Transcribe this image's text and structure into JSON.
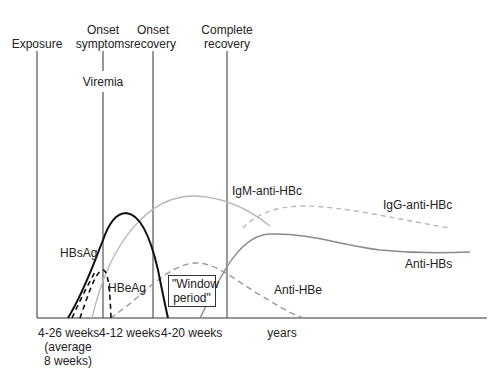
{
  "diagram": {
    "events": [
      {
        "label": "Exposure",
        "x": 37
      },
      {
        "label": "Onset\nsymptoms",
        "line1": "Onset",
        "line2": "symptoms",
        "x": 102
      },
      {
        "label": "Onset\nrecovery",
        "line1": "Onset",
        "line2": "recovery",
        "x": 152
      },
      {
        "label": "Complete\nrecovery",
        "line1": "Complete",
        "line2": "recovery",
        "x": 226
      }
    ],
    "viremia_label": "Viremia",
    "window_period": {
      "line1": "\"Window",
      "line2": "period\""
    },
    "markers": {
      "hbsag": "HBsAg",
      "hbeag": "HBeAg",
      "igm_anti_hbc": "IgM-anti-HBc",
      "igg_anti_hbc": "IgG-anti-HBc",
      "anti_hbs": "Anti-HBs",
      "anti_hbe": "Anti-HBe"
    },
    "time_axis": {
      "intervals": [
        {
          "line1": "4-26 weeks",
          "line2": "(average",
          "line3": "8 weeks)"
        },
        {
          "line1": "4-12 weeks"
        },
        {
          "line1": "4-20 weeks"
        },
        {
          "line1": "years"
        }
      ]
    },
    "colors": {
      "hbsag": "#111111",
      "hbeag": "#111111",
      "igm_anti_hbc": "#b5b5b5",
      "igg_anti_hbc": "#b5b5b5",
      "anti_hbs": "#8a8a8a",
      "anti_hbe": "#999999",
      "event_lines": "#333333"
    }
  }
}
